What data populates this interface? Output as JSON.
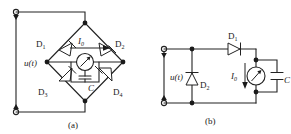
{
  "figure": {
    "type": "circuit-diagram",
    "background": "#ffffff",
    "line_color": "#222222",
    "text_color": "#1a1a1a"
  },
  "circuit_a": {
    "caption": "(a)",
    "source_label": "u(t)",
    "diodes": [
      {
        "id": "D1",
        "label": "D",
        "sub": "1"
      },
      {
        "id": "D2",
        "label": "D",
        "sub": "2"
      },
      {
        "id": "D3",
        "label": "D",
        "sub": "3"
      },
      {
        "id": "D4",
        "label": "D",
        "sub": "4"
      }
    ],
    "current_label": "I",
    "current_sub": "0",
    "capacitor_label": "C",
    "meter_name": "ammeter"
  },
  "circuit_b": {
    "caption": "(b)",
    "source_label": "u(t)",
    "diodes": [
      {
        "id": "D1",
        "label": "D",
        "sub": "1"
      },
      {
        "id": "D2",
        "label": "D",
        "sub": "2"
      }
    ],
    "current_label": "I",
    "current_sub": "0",
    "capacitor_label": "C",
    "meter_name": "ammeter"
  }
}
